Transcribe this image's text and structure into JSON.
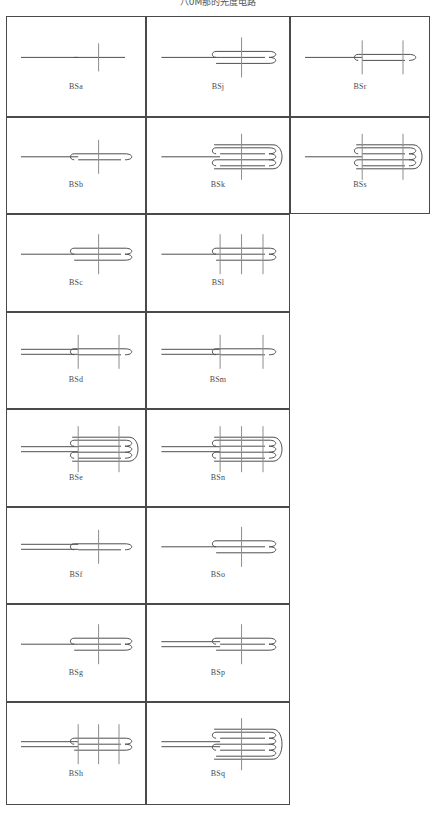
{
  "document": {
    "title": "八0M那的光度电路",
    "type": "technical-diagram-table",
    "background_color": "#ffffff",
    "wire_color": "#4f4f4f",
    "mark_color": "#8d8d8d",
    "border_color": "#4a4a4a",
    "label_color": "#4b4b4b"
  },
  "grid": {
    "columns": 3,
    "column_x": [
      0,
      140,
      284
    ],
    "column_widths": [
      140,
      144,
      140
    ],
    "row_y": [
      0,
      101,
      198,
      296,
      393,
      491,
      588,
      686
    ],
    "row_heights": [
      101,
      97,
      98,
      97,
      98,
      97,
      98,
      103
    ],
    "note": "column 3 only has 2 rows"
  },
  "cells": [
    {
      "label": "BSa",
      "col": 0,
      "row": 0,
      "folds": 1,
      "lead": "single",
      "marks": 1
    },
    {
      "label": "BSj",
      "col": 1,
      "row": 0,
      "folds": 3,
      "lead": "single",
      "marks": 1
    },
    {
      "label": "BSr",
      "col": 2,
      "row": 0,
      "folds": 2,
      "lead": "single",
      "marks": 2
    },
    {
      "label": "BSb",
      "col": 0,
      "row": 1,
      "folds": 2,
      "lead": "single",
      "marks": 1
    },
    {
      "label": "BSk",
      "col": 1,
      "row": 1,
      "folds": 4,
      "lead": "single",
      "marks": 1
    },
    {
      "label": "BSs",
      "col": 2,
      "row": 1,
      "folds": 4,
      "lead": "single",
      "marks": 2
    },
    {
      "label": "BSc",
      "col": 0,
      "row": 2,
      "folds": 3,
      "lead": "single",
      "marks": 1
    },
    {
      "label": "BSl",
      "col": 1,
      "row": 2,
      "folds": 3,
      "lead": "single",
      "marks": 3
    },
    {
      "label": "BSd",
      "col": 0,
      "row": 3,
      "folds": 2,
      "lead": "double",
      "marks": 2
    },
    {
      "label": "BSm",
      "col": 1,
      "row": 3,
      "folds": 2,
      "lead": "double",
      "marks": 2
    },
    {
      "label": "BSe",
      "col": 0,
      "row": 4,
      "folds": 4,
      "lead": "double",
      "marks": 2
    },
    {
      "label": "BSn",
      "col": 1,
      "row": 4,
      "folds": 4,
      "lead": "double",
      "marks": 3
    },
    {
      "label": "BSf",
      "col": 0,
      "row": 5,
      "folds": 2,
      "lead": "double",
      "marks": 1
    },
    {
      "label": "BSo",
      "col": 1,
      "row": 5,
      "folds": 3,
      "lead": "single",
      "marks": 1
    },
    {
      "label": "BSg",
      "col": 0,
      "row": 6,
      "folds": 3,
      "lead": "single",
      "marks": 1
    },
    {
      "label": "BSp",
      "col": 1,
      "row": 6,
      "folds": 3,
      "lead": "double",
      "marks": 1
    },
    {
      "label": "BSh",
      "col": 0,
      "row": 7,
      "folds": 3,
      "lead": "double",
      "marks": 3
    },
    {
      "label": "BSq",
      "col": 1,
      "row": 7,
      "folds": 5,
      "lead": "double",
      "marks": 1
    }
  ]
}
